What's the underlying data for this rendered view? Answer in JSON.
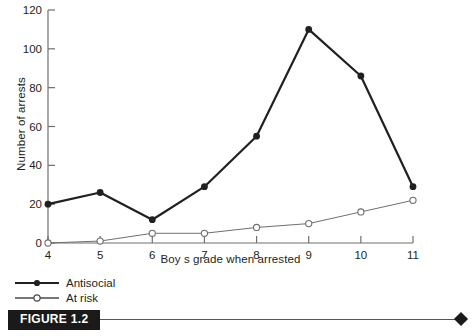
{
  "figure": {
    "tag": "FIGURE 1.2"
  },
  "legend": {
    "items": [
      {
        "label": "Antisocial",
        "marker": "filled-circle",
        "color": "#231f20"
      },
      {
        "label": "At risk",
        "marker": "open-circle",
        "color": "#6f6f6f"
      }
    ]
  },
  "chart_data": {
    "type": "line",
    "title": "",
    "xlabel": "Boy s grade when arrested",
    "ylabel": "Number of arrests",
    "categories": [
      4,
      5,
      6,
      7,
      8,
      9,
      10,
      11
    ],
    "xtick_labels": [
      "4",
      "5",
      "6",
      "7",
      "8",
      "9",
      "10",
      "11"
    ],
    "ytick_labels": [
      "0",
      "20",
      "40",
      "60",
      "80",
      "100",
      "120"
    ],
    "yticks": [
      0,
      20,
      40,
      60,
      80,
      100,
      120
    ],
    "xlim": [
      4,
      11
    ],
    "ylim": [
      0,
      120
    ],
    "grid": false,
    "legend_position": "below-left",
    "series": [
      {
        "name": "Antisocial",
        "marker": "filled-circle",
        "color": "#231f20",
        "linewidth": 2.2,
        "values": [
          20,
          26,
          12,
          29,
          55,
          110,
          86,
          29
        ]
      },
      {
        "name": "At risk",
        "marker": "open-circle",
        "color": "#6f6f6f",
        "linewidth": 1,
        "values": [
          0,
          1,
          5,
          5,
          8,
          10,
          16,
          22
        ]
      }
    ]
  }
}
